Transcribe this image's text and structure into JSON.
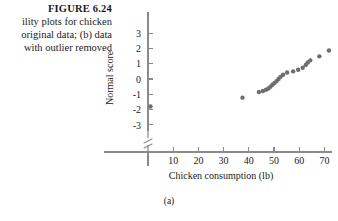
{
  "figure": {
    "number_label": "FIGURE 6.24",
    "caption_lines": [
      "ility plots for chicken",
      "original data; (b) data",
      "with outlier removed"
    ],
    "panel_label": "(a)"
  },
  "chart_data": {
    "type": "scatter",
    "title": "",
    "xlabel": "Chicken consumption (lb)",
    "ylabel": "Normal score",
    "xlim": [
      0,
      85
    ],
    "ylim": [
      -3.6,
      3.4
    ],
    "xticks": [
      10,
      20,
      30,
      40,
      50,
      60,
      70,
      80
    ],
    "yticks": [
      3,
      2,
      1,
      0,
      -1,
      -2,
      -3
    ],
    "xtick_labels": [
      "10",
      "20",
      "30",
      "40",
      "50",
      "60",
      "70",
      "80"
    ],
    "ytick_labels": [
      "3",
      "2",
      "1",
      "0",
      "-1",
      "-2",
      "-3"
    ],
    "grid": false,
    "legend": null,
    "y_axis_break": true,
    "marker_color": "#6e6e6e",
    "axis_color": "#8a8a8a",
    "points": [
      {
        "x": 1.0,
        "y": -1.8
      },
      {
        "x": 37.5,
        "y": -1.22
      },
      {
        "x": 44.0,
        "y": -0.85
      },
      {
        "x": 45.6,
        "y": -0.78
      },
      {
        "x": 46.8,
        "y": -0.7
      },
      {
        "x": 47.8,
        "y": -0.62
      },
      {
        "x": 48.6,
        "y": -0.5
      },
      {
        "x": 49.4,
        "y": -0.38
      },
      {
        "x": 50.2,
        "y": -0.26
      },
      {
        "x": 51.0,
        "y": -0.14
      },
      {
        "x": 51.8,
        "y": 0.0
      },
      {
        "x": 52.6,
        "y": 0.14
      },
      {
        "x": 53.6,
        "y": 0.28
      },
      {
        "x": 55.2,
        "y": 0.42
      },
      {
        "x": 57.6,
        "y": 0.5
      },
      {
        "x": 59.6,
        "y": 0.6
      },
      {
        "x": 61.4,
        "y": 0.74
      },
      {
        "x": 62.6,
        "y": 0.92
      },
      {
        "x": 63.4,
        "y": 1.08
      },
      {
        "x": 64.4,
        "y": 1.22
      },
      {
        "x": 68.0,
        "y": 1.48
      },
      {
        "x": 71.8,
        "y": 1.86
      }
    ]
  }
}
